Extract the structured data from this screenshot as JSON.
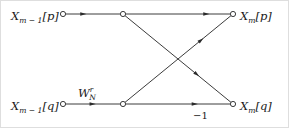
{
  "figure": {
    "type": "signal-flow-graph",
    "name": "radix-2 decimation butterfly",
    "width": 289,
    "height": 128,
    "background_color": "#ffffff",
    "line_color": "#3c3c3c",
    "text_color": "#1a1a1a",
    "border_color": "#d8d8d8"
  },
  "labels": {
    "input_p": {
      "base": "X",
      "sub": "m − 1",
      "bracket": "[p]"
    },
    "input_q": {
      "base": "X",
      "sub": "m − 1",
      "bracket": "[q]"
    },
    "output_p": {
      "base": "X",
      "sub": "m",
      "bracket": "[p]"
    },
    "output_q": {
      "base": "X",
      "sub": "m",
      "bracket": "[q]"
    },
    "twiddle": {
      "base": "W",
      "sub": "N",
      "sup": "r"
    },
    "minus_one": "−1"
  },
  "nodes": [
    {
      "id": "in-p",
      "name": "input-node-p",
      "x": 63,
      "y": 14
    },
    {
      "id": "mid-p",
      "name": "middle-node-p",
      "x": 123,
      "y": 14
    },
    {
      "id": "out-p",
      "name": "output-node-p",
      "x": 233,
      "y": 14
    },
    {
      "id": "in-q",
      "name": "input-node-q",
      "x": 63,
      "y": 104
    },
    {
      "id": "mid-q",
      "name": "middle-node-q",
      "x": 123,
      "y": 104
    },
    {
      "id": "out-q",
      "name": "output-node-q",
      "x": 233,
      "y": 104
    }
  ],
  "edges": [
    {
      "id": "e1",
      "name": "edge-in-p-to-mid-p",
      "from": "in-p",
      "to": "mid-p",
      "arrow_t": 0.38
    },
    {
      "id": "e2",
      "name": "edge-mid-p-to-out-p",
      "from": "mid-p",
      "to": "out-p",
      "arrow_t": 0.8
    },
    {
      "id": "e3",
      "name": "edge-in-q-to-mid-q",
      "from": "in-q",
      "to": "mid-q",
      "arrow_t": 0.55
    },
    {
      "id": "e4",
      "name": "edge-mid-q-to-out-q",
      "from": "mid-q",
      "to": "out-q",
      "arrow_t": 0.69
    },
    {
      "id": "e5",
      "name": "edge-mid-q-to-out-p",
      "from": "mid-q",
      "to": "out-p",
      "arrow_t": 0.74
    },
    {
      "id": "e6",
      "name": "edge-mid-p-to-out-q",
      "from": "mid-p",
      "to": "out-q",
      "arrow_t": 0.7
    }
  ]
}
